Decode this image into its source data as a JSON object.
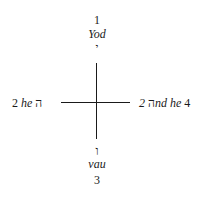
{
  "diagram": {
    "top": {
      "number": "1",
      "name": "Yod",
      "letter": "י"
    },
    "left": {
      "number": "2",
      "name": "he",
      "letter": "ה"
    },
    "right": {
      "letter": "ה",
      "name": "2nd he",
      "number": "4"
    },
    "bottom": {
      "letter": "ו",
      "name": "vau",
      "number": "3"
    },
    "line_color": "#1a1a1a"
  }
}
